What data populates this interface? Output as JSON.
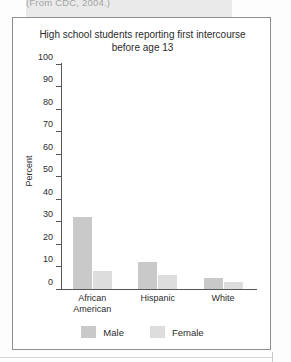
{
  "page": {
    "caption_fragment": "(From CDC, 2004.)"
  },
  "figure": {
    "title_line1": "High school students reporting first intercourse",
    "title_line2": "before age 13"
  },
  "chart_data": {
    "type": "bar",
    "title": "High school students reporting first intercourse before age 13",
    "xlabel": "",
    "ylabel": "Percent",
    "ylim": [
      0,
      100
    ],
    "yticks": [
      0,
      10,
      20,
      30,
      40,
      50,
      60,
      70,
      80,
      90,
      100
    ],
    "ytick_labels": [
      "0",
      "10",
      "20",
      "30",
      "40",
      "50",
      "60",
      "70",
      "80",
      "90",
      "100"
    ],
    "grid": false,
    "legend_position": "bottom",
    "categories": [
      "African American",
      "Hispanic",
      "White"
    ],
    "category_lines": [
      [
        "African",
        "American"
      ],
      [
        "Hispanic"
      ],
      [
        "White"
      ]
    ],
    "series": [
      {
        "name": "Male",
        "color": "#c9c9c9",
        "values": [
          32,
          12,
          5
        ]
      },
      {
        "name": "Female",
        "color": "#dddddd",
        "values": [
          8,
          6,
          3
        ]
      }
    ]
  }
}
